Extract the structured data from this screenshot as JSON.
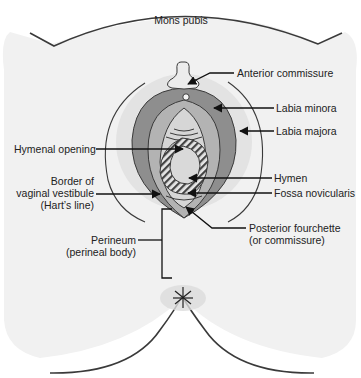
{
  "colors": {
    "background": "#ffffff",
    "body_fill": "#f1f1f1",
    "outline": "#3a3a3a",
    "vestibule_circle": "#e3e3e3",
    "labia_majora_fill": "#8e8e8e",
    "labia_minora_fill": "#b3b3b3",
    "inner_fill": "#d6d6d6",
    "hymen_hatch": "#444444",
    "clitoral_hood": "#ececec",
    "anus_fill": "#dcdcdc"
  },
  "labels": {
    "mons_pubis": "Mons pubis",
    "anterior_commissure": "Anterior commissure",
    "labia_minora": "Labia minora",
    "labia_majora": "Labia majora",
    "hymenal_opening": "Hymenal opening",
    "border_line1": "Border of",
    "border_line2": "vaginal vestibule",
    "border_line3": "(Hart’s line)",
    "hymen": "Hymen",
    "fossa_novicularis": "Fossa novicularis",
    "posterior_line1": "Posterior fourchette",
    "posterior_line2": "(or commissure)",
    "perineum_line1": "Perineum",
    "perineum_line2": "(perineal body)"
  }
}
